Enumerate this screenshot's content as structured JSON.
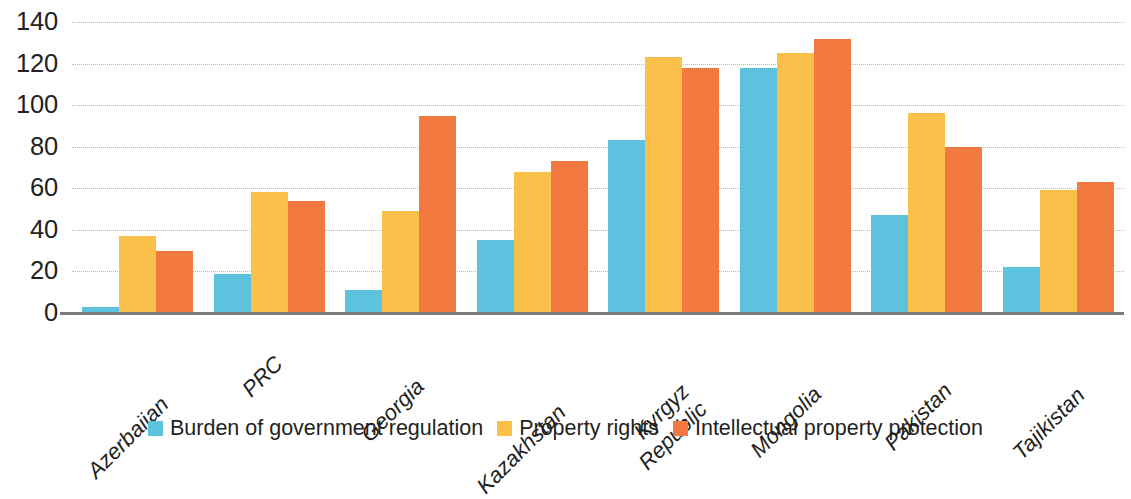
{
  "chart_data": {
    "type": "bar",
    "title": "",
    "xlabel": "",
    "ylabel": "",
    "ylim": [
      0,
      140
    ],
    "yticks": [
      0,
      20,
      40,
      60,
      80,
      100,
      120,
      140
    ],
    "ytick_labels": [
      "0",
      "20",
      "40",
      "60",
      "80",
      "100",
      "120",
      "140"
    ],
    "grid": true,
    "grid_style": "dotted horizontal",
    "legend_position": "bottom-center",
    "categories": [
      "Azerbaijan",
      "PRC",
      "Georgia",
      "Kazakhstan",
      "Kyrgyz\nRepublic",
      "Mongolia",
      "Pakistan",
      "Tajikistan"
    ],
    "series": [
      {
        "name": "Burden of government regulation",
        "color": "#5cc2dd",
        "values": [
          3,
          19,
          11,
          35,
          83,
          118,
          47,
          22
        ]
      },
      {
        "name": "Property rights",
        "color": "#fbc04a",
        "values": [
          37,
          58,
          49,
          68,
          123,
          125,
          96,
          59
        ]
      },
      {
        "name": "Intellectual property protection",
        "color": "#f2793f",
        "values": [
          30,
          54,
          95,
          73,
          118,
          132,
          80,
          63
        ]
      }
    ]
  },
  "axis": {
    "baseline_color": "#7b7b80",
    "gridline_color": "#b9b9bc",
    "tick_text_color": "#231f20"
  }
}
